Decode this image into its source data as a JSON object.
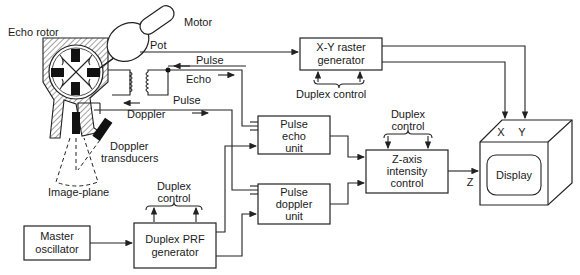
{
  "diagram": {
    "labels": {
      "echo_rotor": "Echo rotor",
      "motor": "Motor",
      "pot": "Pot",
      "pulse_top": "Pulse",
      "echo": "Echo",
      "pulse_mid": "Pulse",
      "doppler": "Doppler",
      "doppler_transducers_1": "Doppler",
      "doppler_transducers_2": "transducers",
      "image_plane": "Image-plane",
      "duplex_control_raster": "Duplex control",
      "duplex_control_z_1": "Duplex",
      "duplex_control_z_2": "control",
      "duplex_control_prf_1": "Duplex",
      "duplex_control_prf_2": "control",
      "x": "X",
      "y": "Y",
      "z": "Z"
    },
    "blocks": {
      "xy_raster": [
        "X-Y raster",
        "generator"
      ],
      "pulse_echo": [
        "Pulse",
        "echo",
        "unit"
      ],
      "pulse_doppler": [
        "Pulse",
        "doppler",
        "unit"
      ],
      "z_axis": [
        "Z-axis",
        "intensity",
        "control"
      ],
      "master_osc": [
        "Master",
        "oscillator"
      ],
      "duplex_prf": [
        "Duplex PRF",
        "generator"
      ],
      "display": "Display"
    }
  }
}
